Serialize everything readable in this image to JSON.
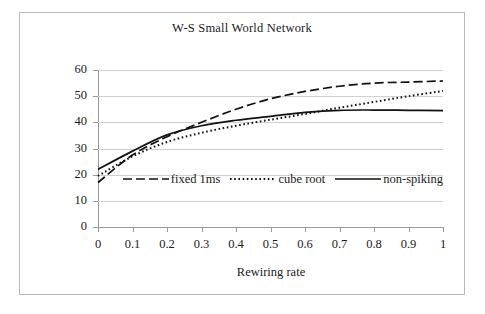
{
  "chart_data": {
    "type": "line",
    "title": "W-S Small World Network",
    "xlabel": "Rewiring rate",
    "ylabel": "",
    "xlim": [
      0,
      1
    ],
    "ylim": [
      0,
      60
    ],
    "grid": true,
    "legend_position": "inside-center",
    "x": [
      0,
      0.1,
      0.2,
      0.3,
      0.4,
      0.5,
      0.6,
      0.7,
      0.8,
      0.9,
      1.0
    ],
    "xticks": [
      "0",
      "0.1",
      "0.2",
      "0.3",
      "0.4",
      "0.5",
      "0.6",
      "0.7",
      "0.8",
      "0.9",
      "1"
    ],
    "yticks": [
      "0",
      "10",
      "20",
      "30",
      "40",
      "50",
      "60"
    ],
    "series": [
      {
        "name": "fixed 1ms",
        "style": "dashed",
        "color": "#111111",
        "values": [
          17.0,
          27.5,
          34.5,
          40.0,
          45.0,
          49.0,
          51.8,
          53.8,
          55.0,
          55.4,
          55.8
        ]
      },
      {
        "name": "cube root",
        "style": "dotted",
        "color": "#111111",
        "values": [
          19.5,
          27.0,
          32.5,
          36.0,
          38.7,
          41.0,
          43.2,
          45.6,
          47.8,
          50.0,
          52.0
        ]
      },
      {
        "name": "non-spiking",
        "style": "solid",
        "color": "#111111",
        "values": [
          22.0,
          29.0,
          35.2,
          38.7,
          40.8,
          42.3,
          43.8,
          44.6,
          44.7,
          44.6,
          44.5
        ]
      }
    ]
  },
  "legend": {
    "items": [
      {
        "label": "fixed 1ms"
      },
      {
        "label": "cube root"
      },
      {
        "label": "non-spiking"
      }
    ]
  }
}
